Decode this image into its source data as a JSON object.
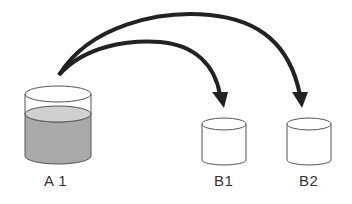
{
  "diagram": {
    "containers": [
      {
        "id": "A1",
        "label": "A 1",
        "filled": true
      },
      {
        "id": "B1",
        "label": "B1",
        "filled": false
      },
      {
        "id": "B2",
        "label": "B2",
        "filled": false
      }
    ],
    "arrows": [
      {
        "from": "A1",
        "to": "B1"
      },
      {
        "from": "A1",
        "to": "B2"
      }
    ],
    "colors": {
      "liquid": "#a9a9a9",
      "liquid_top": "#d0d0d0",
      "outline": "#555555",
      "arrow": "#222222"
    }
  }
}
